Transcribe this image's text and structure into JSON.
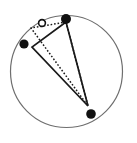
{
  "figure": {
    "title": "",
    "caption": "",
    "canvas": {
      "width": 137,
      "height": 143,
      "background": "#ffffff"
    },
    "colors": {
      "outline": "#6e6e6e",
      "solid_stroke": "#1a1a1a",
      "dotted_stroke": "#1a1a1a",
      "filled_marker": "#111111",
      "open_marker_stroke": "#111111",
      "open_marker_fill": "#ffffff"
    }
  },
  "chart_data": {
    "type": "scatter",
    "title": "",
    "xlabel": "",
    "ylabel": "",
    "xlim": [
      0,
      137
    ],
    "ylim": [
      143,
      0
    ],
    "grid": false,
    "legend": "none",
    "boundary": {
      "shape": "circle",
      "cx": 66.5,
      "cy": 71.5,
      "r": 56.0,
      "stroke_width": 1.2,
      "fill": "none"
    },
    "points": [
      {
        "label": "p1",
        "x": 66,
        "y": 19,
        "marker": "filled-circle",
        "size": 5.0
      },
      {
        "label": "p2",
        "x": 24,
        "y": 44,
        "marker": "filled-circle",
        "size": 4.6
      },
      {
        "label": "p3",
        "x": 91,
        "y": 114,
        "marker": "filled-circle",
        "size": 4.8
      },
      {
        "label": "p4",
        "x": 42,
        "y": 23,
        "marker": "open-circle",
        "size": 3.4
      }
    ],
    "polygons": [
      {
        "name": "solid-triangle",
        "style": "solid",
        "stroke_width": 1.7,
        "fill": "none",
        "vertices": [
          {
            "x": 66,
            "y": 22
          },
          {
            "x": 32,
            "y": 47
          },
          {
            "x": 88,
            "y": 106
          }
        ]
      },
      {
        "name": "dotted-triangle",
        "style": "dotted",
        "stroke_width": 1.5,
        "dash": "1.6 1.9",
        "fill": "none",
        "vertices": [
          {
            "x": 66,
            "y": 22
          },
          {
            "x": 31,
            "y": 28
          },
          {
            "x": 88,
            "y": 106
          }
        ]
      }
    ],
    "segments": [
      {
        "name": "dotted-chord-left",
        "style": "dotted",
        "stroke_width": 1.5,
        "dash": "1.6 1.9",
        "from": {
          "x": 31,
          "y": 28
        },
        "to": {
          "x": 88,
          "y": 106
        }
      }
    ]
  }
}
